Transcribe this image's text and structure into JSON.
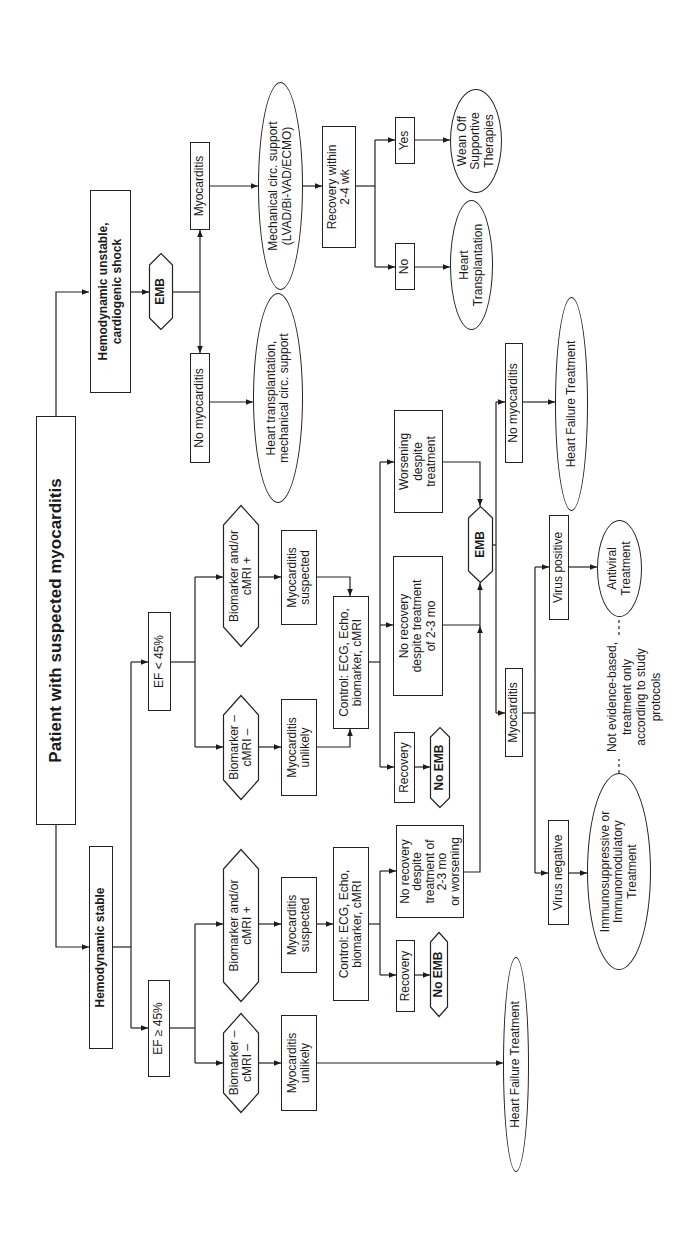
{
  "flowchart": {
    "root": "Patient with suspected myocarditis",
    "unstable": {
      "label": "Hemodynamic unstable,\ncardiogenic shock",
      "emb": "EMB",
      "myocarditis": "Myocarditis",
      "no_myocarditis": "No myocarditis",
      "mcs": "Mechanical circ. support\n(LVAD/Bi-VAD/ECMO)",
      "ht_or_mcs": "Heart transplantation,\nmechanical circ. support",
      "recovery_check": "Recovery within\n2-4 wk",
      "yes": "Yes",
      "no": "No",
      "wean_off": "Wean Off\nSupportive\nTherapies",
      "heart_transplantation": "Heart\nTransplantation"
    },
    "stable": {
      "label": "Hemodynamic stable",
      "ef_lt_45": {
        "label": "EF < 45%",
        "biomarker_pos": "Biomarker and/or\ncMRI +",
        "biomarker_neg": "Biomarker –\ncMRI –",
        "myocarditis_suspected": "Myocarditis\nsuspected",
        "myocarditis_unlikely": "Myocarditis\nunlikely",
        "control": "Control: ECG, Echo,\nbiomarker, cMRI",
        "worsening": "Worsening\ndespite\ntreatment",
        "no_recovery": "No recovery\ndespite treatment\nof 2-3 mo",
        "recovery": "Recovery",
        "no_emb": "No EMB"
      },
      "ef_ge_45": {
        "label": "EF ≥ 45%",
        "biomarker_pos": "Biomarker and/or\ncMRI +",
        "biomarker_neg": "Biomarker –\ncMRI –",
        "myocarditis_suspected": "Myocarditis\nsuspected",
        "myocarditis_unlikely": "Myocarditis\nunlikely",
        "control": "Control: ECG, Echo,\nbiomarker, cMRI",
        "no_recovery": "No recovery\ndespite\ntreatment of\n2-3 mo\nor worsening",
        "recovery": "Recovery",
        "no_emb": "No EMB",
        "heart_failure_treatment": "Heart Failure Treatment"
      },
      "emb_result": {
        "emb": "EMB",
        "no_myocarditis": "No myocarditis",
        "heart_failure_treatment": "Heart Failure Treatment",
        "myocarditis": "Myocarditis",
        "virus_positive": "Virus positive",
        "virus_negative": "Virus negative",
        "antiviral": "Antiviral\nTreatment",
        "immuno": "Immunosuppressive or\nImmunomodulatory\nTreatment",
        "note": "Not evidence-based,\ntreatment only\naccording to study\nprotocols"
      }
    }
  },
  "colors": {
    "background": "#ffffff",
    "line": "#222222",
    "text": "#1a1a1a"
  }
}
